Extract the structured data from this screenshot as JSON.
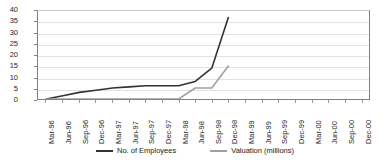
{
  "chart_data": {
    "type": "line",
    "title": "",
    "xlabel": "",
    "ylabel": "",
    "ylim": [
      0,
      40
    ],
    "yticks": [
      0,
      5,
      10,
      15,
      20,
      25,
      30,
      35,
      40
    ],
    "grid": true,
    "legend_position": "bottom",
    "categories": [
      "Mar-96",
      "Jun-96",
      "Sep-96",
      "Dec-96",
      "Mar-97",
      "Jun-97",
      "Sep-97",
      "Dec-97",
      "Mar-98",
      "Jun-98",
      "Sep-98",
      "Dec-98",
      "Mar-99",
      "Jun-99",
      "Sep-99",
      "Dec-99",
      "Mar-00",
      "Jun-00",
      "Sep-00",
      "Dec-00"
    ],
    "series": [
      {
        "name": "No. of Employees",
        "color": "#333333",
        "values": [
          0,
          1.5,
          3,
          4,
          5,
          5.5,
          6,
          6,
          6,
          8,
          14,
          37,
          null,
          null,
          null,
          null,
          null,
          null,
          null,
          null
        ]
      },
      {
        "name": "Valuation (millions)",
        "color": "#a0a0a0",
        "values": [
          0,
          0,
          0,
          0,
          0,
          0,
          0,
          0,
          0,
          5,
          5,
          15,
          null,
          null,
          null,
          null,
          null,
          null,
          null,
          null
        ]
      }
    ]
  },
  "legend": {
    "items": [
      {
        "label": "No. of Employees",
        "color": "#333333"
      },
      {
        "label": "Valuation (millions)",
        "color": "#a0a0a0"
      }
    ]
  }
}
